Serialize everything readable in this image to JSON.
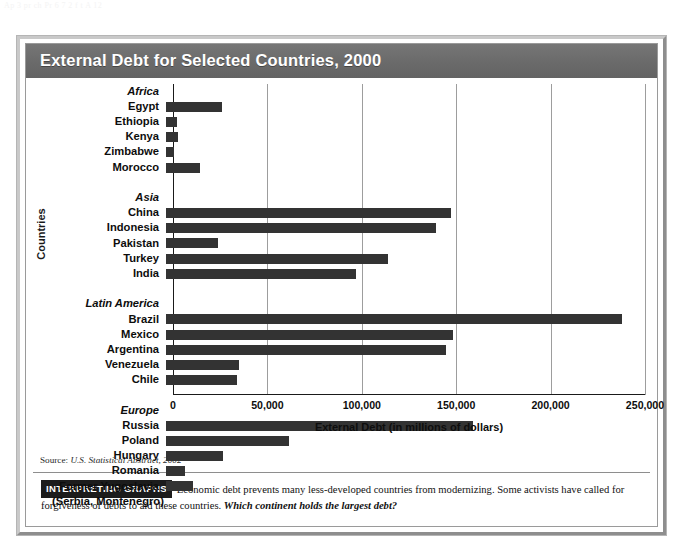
{
  "page": {
    "residue_text": "Ap 3 pr ch   Pr 6 7 2 f  t  A  12"
  },
  "figure": {
    "title": "External Debt for Selected Countries, 2000",
    "source": {
      "prefix": "Source:",
      "text": "U.S. Statistical Abstract, 2002"
    },
    "footer": {
      "badge": "INTERPRETING GRAPHS",
      "body": "Economic debt prevents many less-developed countries from modernizing. Some activists have called for forgiveness of debts to aid these countries.",
      "question": "Which continent holds the largest debt?"
    },
    "colors": {
      "bar": "#333333",
      "title_bar": "#6e6e6e",
      "frame": "#c9c9c9",
      "gridline": "#9d9d9d",
      "axis": "#1a1a1a"
    }
  },
  "chart_data": {
    "type": "bar",
    "orientation": "horizontal",
    "title": "External Debt for Selected Countries, 2000",
    "xlabel": "External Debt (in millions of dollars)",
    "ylabel": "Countries",
    "xlim": [
      0,
      250000
    ],
    "xticks": [
      0,
      50000,
      100000,
      150000,
      200000,
      250000
    ],
    "xtick_labels": [
      "0",
      "50,000",
      "100,000",
      "150,000",
      "200,000",
      "250,000"
    ],
    "grid": "vertical",
    "legend": "none",
    "units": "millions of dollars",
    "rows": [
      {
        "label": "Africa",
        "type": "group",
        "value": null
      },
      {
        "label": "Egypt",
        "type": "bar",
        "value": 29000
      },
      {
        "label": "Ethiopia",
        "type": "bar",
        "value": 5500
      },
      {
        "label": "Kenya",
        "type": "bar",
        "value": 6300
      },
      {
        "label": "Zimbabwe",
        "type": "bar",
        "value": 4000
      },
      {
        "label": "Morocco",
        "type": "bar",
        "value": 17800
      },
      {
        "label": "",
        "type": "spacer",
        "value": null
      },
      {
        "label": "Asia",
        "type": "group",
        "value": null
      },
      {
        "label": "China",
        "type": "bar",
        "value": 149000
      },
      {
        "label": "Indonesia",
        "type": "bar",
        "value": 141000
      },
      {
        "label": "Pakistan",
        "type": "bar",
        "value": 27000
      },
      {
        "label": "Turkey",
        "type": "bar",
        "value": 116000
      },
      {
        "label": "India",
        "type": "bar",
        "value": 99000
      },
      {
        "label": "",
        "type": "spacer",
        "value": null
      },
      {
        "label": "Latin America",
        "type": "group",
        "value": null
      },
      {
        "label": "Brazil",
        "type": "bar",
        "value": 238000
      },
      {
        "label": "Mexico",
        "type": "bar",
        "value": 150000
      },
      {
        "label": "Argentina",
        "type": "bar",
        "value": 146000
      },
      {
        "label": "Venezuela",
        "type": "bar",
        "value": 38000
      },
      {
        "label": "Chile",
        "type": "bar",
        "value": 37000
      },
      {
        "label": "",
        "type": "spacer",
        "value": null
      },
      {
        "label": "Europe",
        "type": "group",
        "value": null
      },
      {
        "label": "Russia",
        "type": "bar",
        "value": 160000
      },
      {
        "label": "Poland",
        "type": "bar",
        "value": 64000
      },
      {
        "label": "Hungary",
        "type": "bar",
        "value": 30000
      },
      {
        "label": "Romania",
        "type": "bar",
        "value": 10000
      },
      {
        "label": "Former Yugoslavia",
        "type": "bar",
        "value": 14000
      },
      {
        "label": "(Serbia, Montenegro)",
        "type": "caption",
        "value": null
      }
    ]
  }
}
